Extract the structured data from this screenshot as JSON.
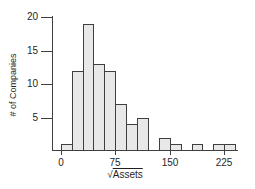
{
  "figure": {
    "ylabel": "# of Companies",
    "xlabel_radical": "√",
    "xlabel_word": "Assets"
  },
  "chart_data": {
    "type": "bar",
    "title": "",
    "subtitle": "",
    "xlabel": "√Assets",
    "ylabel": "# of Companies",
    "bin_start": 0,
    "bin_width": 15,
    "bin_edges": [
      0,
      15,
      30,
      45,
      60,
      75,
      90,
      105,
      120,
      135,
      150,
      165,
      180,
      195,
      210,
      225,
      240
    ],
    "values": [
      1,
      12,
      19,
      13,
      12,
      7,
      4,
      5,
      0,
      2,
      1,
      0,
      1,
      0,
      1,
      1
    ],
    "x_ticks": [
      0,
      75,
      150,
      225
    ],
    "y_ticks": [
      5,
      10,
      15,
      20
    ],
    "xlim": [
      -12,
      244
    ],
    "ylim": [
      0,
      20.5
    ],
    "grid": false,
    "legend": null,
    "colors": {
      "bg": "#ffffff",
      "bar_fill": "#e8e8e8",
      "bar_border": "#3f3f3f",
      "axis": "#3f3f3f",
      "text": "#1f1f1f"
    }
  }
}
